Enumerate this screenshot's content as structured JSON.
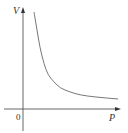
{
  "chart_data": {
    "type": "line",
    "title": "",
    "xlabel": "P",
    "ylabel": "V",
    "origin_label": "0",
    "grid": false,
    "legend": null,
    "series": [
      {
        "name": "V vs P",
        "relation": "V = k / P",
        "points_px": [
          [
            34,
            12
          ],
          [
            37,
            30
          ],
          [
            40,
            48
          ],
          [
            44,
            64
          ],
          [
            48,
            75
          ],
          [
            54,
            82
          ],
          [
            60,
            88
          ],
          [
            70,
            92
          ],
          [
            80,
            95
          ],
          [
            95,
            97
          ],
          [
            118,
            99
          ]
        ]
      }
    ],
    "colors": {
      "axis": "#555555",
      "curve": "#666666",
      "text": "#333333"
    }
  }
}
